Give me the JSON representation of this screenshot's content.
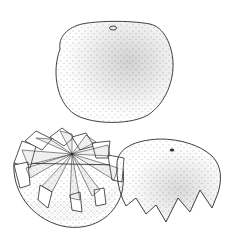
{
  "illustration": {
    "subject": "Zig-zag cut citrus fruit",
    "style": "stippled pen-and-ink line drawing",
    "parts": [
      {
        "name": "whole-fruit",
        "description": "Whole uncut fruit with stem scar at top"
      },
      {
        "name": "bottom-half",
        "description": "Lower half with zig-zag crown cut showing segments"
      },
      {
        "name": "cap-half",
        "description": "Upper cap with zig-zag cut edge, tilted to the right"
      }
    ],
    "colors": {
      "ink": "#2a2a2a",
      "paper": "#ffffff",
      "stipple": "#555555",
      "segment_shade": "#9a9a9a"
    }
  }
}
